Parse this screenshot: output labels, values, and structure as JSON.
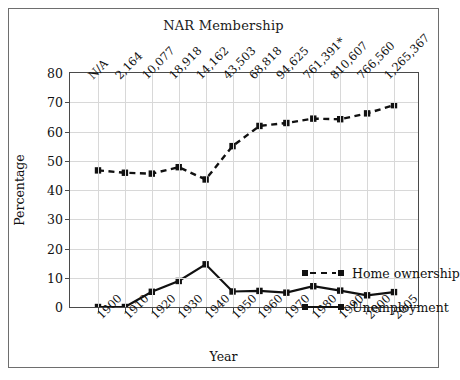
{
  "chart_data": {
    "type": "line",
    "title": "NAR Membership",
    "xlabel": "Year",
    "ylabel": "Percentage",
    "ylim": [
      0,
      80
    ],
    "ytick_labels": [
      "0",
      "10",
      "20",
      "30",
      "40",
      "50",
      "60",
      "70",
      "80"
    ],
    "yticks": [
      0,
      10,
      20,
      30,
      40,
      50,
      60,
      70,
      80
    ],
    "grid": true,
    "legend_position": "center-right",
    "categories": [
      "1900",
      "1910",
      "1920",
      "1930",
      "1940",
      "1950",
      "1960",
      "1970",
      "1980",
      "1990",
      "2000",
      "2005"
    ],
    "x": [
      1900,
      1910,
      1920,
      1930,
      1940,
      1950,
      1960,
      1970,
      1980,
      1990,
      2000,
      2005
    ],
    "top_axis": {
      "title": "NAR Membership",
      "tick_labels": [
        "N/A",
        "2,164",
        "10,077",
        "18,918",
        "14,162",
        "43,503",
        "68,818",
        "94,625",
        "761,391*",
        "810,607",
        "766,560",
        "1,265,367"
      ]
    },
    "series": [
      {
        "name": "Home ownership",
        "style": "dashed",
        "marker": "square",
        "color": "#111111",
        "values": [
          46.7,
          45.9,
          45.6,
          47.8,
          43.6,
          55.0,
          61.9,
          62.9,
          64.4,
          64.2,
          66.2,
          69.0
        ]
      },
      {
        "name": "Unemployment",
        "style": "solid",
        "marker": "square",
        "color": "#111111",
        "values": [
          0.0,
          0.0,
          5.2,
          8.9,
          14.6,
          5.3,
          5.5,
          4.9,
          7.1,
          5.6,
          4.0,
          5.1
        ]
      }
    ]
  }
}
